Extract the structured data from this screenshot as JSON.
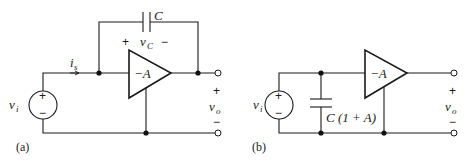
{
  "figure": {
    "panel_a": {
      "label": "(a)",
      "source": {
        "var": "v",
        "sub": "i",
        "plus": "+",
        "minus": "−"
      },
      "current": {
        "var": "i",
        "sub": "s"
      },
      "capacitor": {
        "label": "C",
        "voltage_var": "v",
        "voltage_sub": "C",
        "plus": "+",
        "minus": "−"
      },
      "amplifier": {
        "gain": "−A"
      },
      "output": {
        "var": "v",
        "sub": "o",
        "plus": "+",
        "minus": "−"
      }
    },
    "panel_b": {
      "label": "(b)",
      "source": {
        "var": "v",
        "sub": "i",
        "plus": "+",
        "minus": "−"
      },
      "capacitor": {
        "label": "C (1 + A)"
      },
      "amplifier": {
        "gain": "−A"
      },
      "output": {
        "var": "v",
        "sub": "o",
        "plus": "+",
        "minus": "−"
      }
    }
  }
}
